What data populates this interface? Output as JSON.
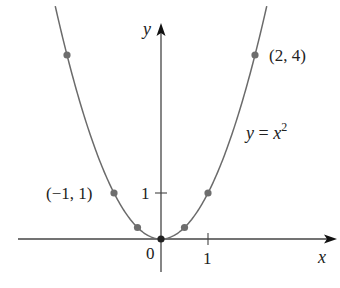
{
  "chart_data": {
    "type": "line",
    "title": "",
    "equation_label": "y = x²",
    "xlabel": "x",
    "ylabel": "y",
    "function": "y = x^2",
    "x_tick_labels": [
      "0",
      "1"
    ],
    "y_tick_labels": [
      "1"
    ],
    "xlim": [
      -3.05,
      3.7
    ],
    "ylim": [
      -0.7,
      4.7
    ],
    "grid": false,
    "legend": "none",
    "points": [
      {
        "x": -2,
        "y": 4
      },
      {
        "x": -1,
        "y": 1
      },
      {
        "x": -0.5,
        "y": 0.25
      },
      {
        "x": 0,
        "y": 0
      },
      {
        "x": 0.5,
        "y": 0.25
      },
      {
        "x": 1,
        "y": 1
      },
      {
        "x": 2,
        "y": 4
      }
    ],
    "annotations": [
      {
        "text": "(2, 4)",
        "x": 2,
        "y": 4
      },
      {
        "text": "(−1, 1)",
        "x": -1,
        "y": 1
      },
      {
        "text": "y = x²",
        "x": 1.8,
        "y": 2.2
      }
    ],
    "colors": {
      "curve": "#6b6b6b",
      "points": "#6e6e6e",
      "axes": "#444444",
      "origin_point": "#222222"
    }
  },
  "labels": {
    "y_axis": "y",
    "x_axis": "x",
    "origin": "0",
    "x_tick_1": "1",
    "y_tick_1": "1",
    "pt_2_4": "(2, 4)",
    "pt_m1_1": "(−1, 1)",
    "eq_y": "y",
    "eq_eq": " = ",
    "eq_x": "x",
    "eq_exp": "2"
  }
}
